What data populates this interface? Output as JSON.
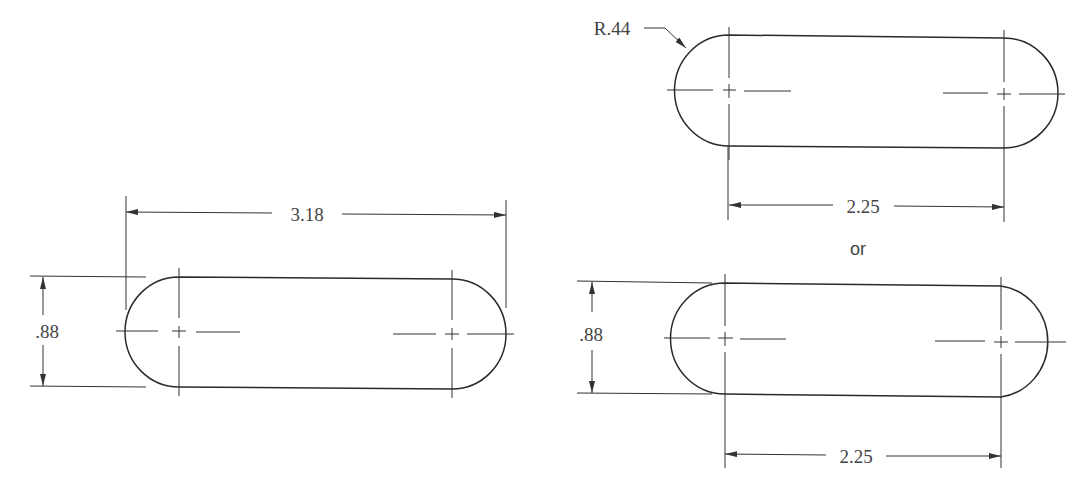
{
  "drawing": {
    "title": "Slot dimensioning methods",
    "left_view": {
      "overall_length_label": "3.18",
      "height_label": ".88"
    },
    "top_right_view": {
      "radius_label": "R.44",
      "center_distance_label": "2.25"
    },
    "separator_label": "or",
    "bottom_right_view": {
      "height_label": ".88",
      "center_distance_label": "2.25"
    }
  }
}
